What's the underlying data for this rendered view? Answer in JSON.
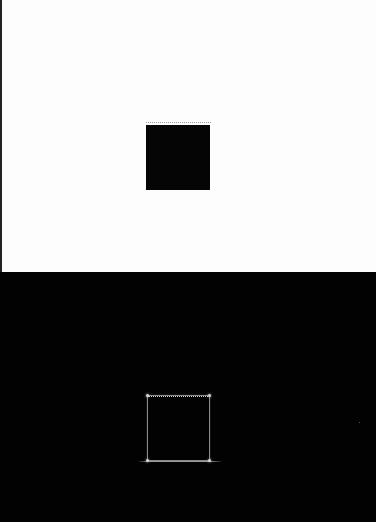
{
  "image": {
    "description": "Two-panel image: top panel shows a solid black square on a white background; bottom panel shows the edge-detected outline of the same square on a black background",
    "panels": [
      {
        "name": "original",
        "background": "#fdfdfd",
        "shape": {
          "type": "square",
          "fill": "#050505",
          "x": 146,
          "y": 125,
          "width": 64,
          "height": 65
        }
      },
      {
        "name": "edges",
        "background": "#020202",
        "shape": {
          "type": "square-outline",
          "stroke": "#8a8a8a",
          "x": 147,
          "y": 395,
          "width": 63,
          "height": 66
        }
      }
    ]
  }
}
